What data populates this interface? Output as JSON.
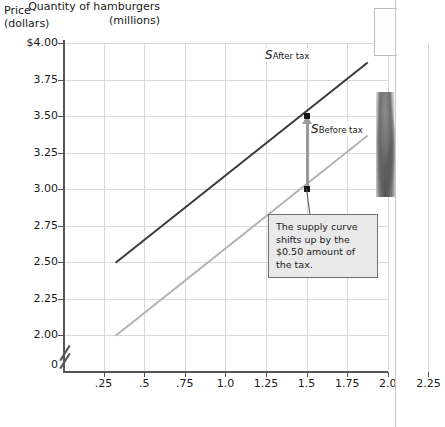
{
  "chart_data": {
    "type": "line",
    "title": "",
    "xlabel": "Quantity of hamburgers (millions)",
    "ylabel": "Price (dollars)",
    "xlim": [
      0.0,
      2.25
    ],
    "ylim": [
      2.0,
      4.0
    ],
    "ybreak": true,
    "grid": true,
    "legend_position": "inline-curve-labels",
    "xticks": [
      ".25",
      ".5",
      ".75",
      "1.0",
      "1.25",
      "1.5",
      "1.75",
      "2.0",
      "2.25"
    ],
    "xtick_values": [
      0.25,
      0.5,
      0.75,
      1.0,
      1.25,
      1.5,
      1.75,
      2.0,
      2.25
    ],
    "yticks": [
      "$4.00",
      "3.75",
      "3.50",
      "3.25",
      "3.00",
      "2.75",
      "2.50",
      "2.25",
      "2.00"
    ],
    "ytick_values": [
      4.0,
      3.75,
      3.5,
      3.25,
      3.0,
      2.75,
      2.5,
      2.25,
      2.0
    ],
    "origin_label": "0",
    "series": [
      {
        "name": "S After tax",
        "label_main": "S",
        "label_sub": "After tax",
        "color": "#3a3a3a",
        "x": [
          0.32,
          1.87
        ],
        "values": [
          2.5,
          3.87
        ]
      },
      {
        "name": "S Before tax",
        "label_main": "S",
        "label_sub": "Before tax",
        "color": "#b3b3b3",
        "x": [
          0.32,
          1.87
        ],
        "values": [
          2.0,
          3.37
        ]
      }
    ],
    "annotations": [
      {
        "kind": "shift-arrow",
        "x": 1.5,
        "y_from": 3.0,
        "y_to": 3.5,
        "amount": 0.5,
        "color": "#9a9a9a"
      },
      {
        "kind": "point",
        "x": 1.5,
        "y": 3.5
      },
      {
        "kind": "point",
        "x": 1.5,
        "y": 3.0
      },
      {
        "kind": "callout",
        "text": "The supply curve shifts up by the $0.50 amount of the tax."
      }
    ]
  },
  "axes": {
    "y_title_line1": "Price",
    "y_title_line2": "(dollars)",
    "x_title_line1": "Quantity of hamburgers",
    "x_title_line2": "(millions)"
  },
  "callout": {
    "text": "The supply curve shifts up by the $0.50 amount of the tax."
  },
  "colors": {
    "after_tax_curve": "#3a3a3a",
    "before_tax_curve": "#b3b3b3",
    "arrow": "#9a9a9a",
    "gridline": "#d8d8d8",
    "axis": "#555555",
    "callout_bg": "#e9e9e9",
    "callout_border": "#6f6f6f"
  }
}
